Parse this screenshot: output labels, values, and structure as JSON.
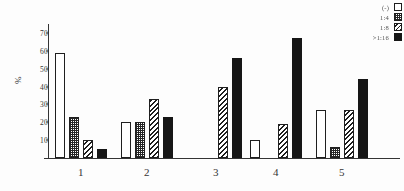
{
  "chart_data": {
    "type": "bar",
    "title": "",
    "subtitle": "",
    "xlabel": "",
    "ylabel": "%",
    "categories": [
      "1",
      "2",
      "3",
      "4",
      "5"
    ],
    "ylim": [
      0,
      75
    ],
    "yticks": [
      10,
      20,
      30,
      40,
      50,
      60,
      70
    ],
    "ytick_labels": [
      "10",
      "20",
      "30",
      "40",
      "50",
      "60",
      "70"
    ],
    "grid": false,
    "legend_position": "top-right",
    "series": [
      {
        "name": "(-)",
        "pattern": "white",
        "color": "#ffffff",
        "values": [
          59,
          20,
          0,
          10,
          27
        ]
      },
      {
        "name": "1:4",
        "pattern": "dotted",
        "color": "#ffffff",
        "values": [
          23,
          20,
          0,
          0,
          6
        ]
      },
      {
        "name": "1:8",
        "pattern": "hatched",
        "color": "#ffffff",
        "values": [
          10,
          33,
          40,
          19,
          27
        ]
      },
      {
        "name": ">1:16",
        "pattern": "solid-black",
        "color": "#0a0a0a",
        "values": [
          5,
          23,
          56,
          67,
          44
        ]
      }
    ]
  },
  "legend": {
    "entries": [
      {
        "label": "(-)",
        "swatch": "legend-swatch-white"
      },
      {
        "label": "1:4",
        "swatch": "legend-swatch-dotted"
      },
      {
        "label": "1:8",
        "swatch": "legend-swatch-hatched"
      },
      {
        "label": ">1:16",
        "swatch": "legend-swatch-black"
      }
    ]
  },
  "axes": {
    "y_title": "%",
    "y_tick_labels": [
      "70",
      "60",
      "50",
      "40",
      "30",
      "20",
      "10"
    ],
    "x_tick_labels": [
      "1",
      "2",
      "3",
      "4",
      "5"
    ]
  }
}
